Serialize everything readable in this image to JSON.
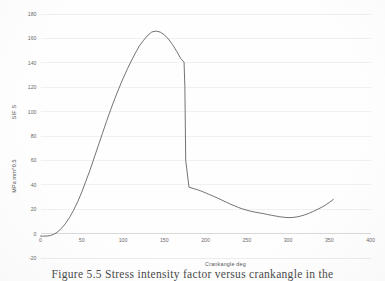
{
  "figure": {
    "caption": "Figure 5.5  Stress intensity factor versus crankangle in the",
    "background": "#fefefe",
    "line_color": "#5a5a5a",
    "grid_color": "#d9d9d9"
  },
  "chart_data": {
    "type": "line",
    "title": "",
    "xlabel": "Crankangle   deg",
    "ylabel": "SIF S      MPa mm^0.5",
    "ylabel_parts": [
      "SIF S",
      "MPa mm^0.5"
    ],
    "xlim": [
      0,
      400
    ],
    "ylim": [
      -20,
      180
    ],
    "xticks": [
      0,
      50,
      100,
      150,
      200,
      250,
      300,
      350,
      400
    ],
    "xtick_labels": [
      "0",
      "50",
      "100",
      "150",
      "200",
      "250",
      "300",
      "350",
      "400"
    ],
    "yticks": [
      -20,
      0,
      20,
      40,
      60,
      80,
      100,
      120,
      140,
      160,
      180
    ],
    "ytick_labels": [
      "-20",
      "0",
      "20",
      "40",
      "60",
      "80",
      "100",
      "120",
      "140",
      "160",
      "180"
    ],
    "grid": "horizontal",
    "legend": "none",
    "series": [
      {
        "name": "SIF",
        "color": "#5a5a5a",
        "x": [
          0,
          4,
          8,
          12,
          16,
          20,
          25,
          30,
          35,
          40,
          45,
          50,
          55,
          60,
          65,
          70,
          75,
          80,
          85,
          90,
          95,
          100,
          105,
          110,
          115,
          120,
          125,
          130,
          135,
          140,
          145,
          150,
          155,
          160,
          165,
          170,
          174,
          175,
          176,
          180,
          185,
          190,
          195,
          200,
          205,
          210,
          215,
          220,
          225,
          230,
          235,
          240,
          245,
          250,
          255,
          260,
          265,
          270,
          275,
          280,
          285,
          290,
          295,
          300,
          305,
          310,
          315,
          320,
          325,
          330,
          335,
          340,
          345,
          350,
          355
        ],
        "y": [
          -2.0,
          -2.1,
          -2.0,
          -1.6,
          -0.6,
          1.0,
          4.0,
          8.0,
          13.0,
          19.0,
          26.0,
          34.0,
          43.0,
          52.0,
          62.0,
          72.0,
          82.0,
          92.0,
          101.5,
          110.5,
          119.0,
          127.0,
          134.5,
          141.5,
          148.0,
          154.0,
          158.5,
          162.5,
          165.3,
          166.0,
          165.2,
          163.0,
          159.5,
          155.0,
          149.5,
          143.5,
          140.5,
          120.0,
          60.0,
          38.0,
          37.0,
          36.0,
          34.8,
          33.4,
          32.0,
          30.5,
          29.0,
          27.4,
          25.8,
          24.2,
          22.8,
          21.4,
          20.2,
          19.2,
          18.3,
          17.6,
          17.0,
          16.4,
          15.7,
          15.0,
          14.4,
          13.8,
          13.4,
          13.1,
          13.2,
          13.6,
          14.3,
          15.3,
          16.5,
          18.0,
          19.6,
          21.3,
          23.2,
          25.5,
          28.0
        ],
        "annotations": {
          "peak_value": 166,
          "peak_x": 138,
          "drop_x": 175,
          "drop_from": 140,
          "drop_to": 38,
          "min_value": 13,
          "min_x": 300,
          "end_value": 28,
          "end_x": 355,
          "start_value": -2
        }
      }
    ]
  }
}
